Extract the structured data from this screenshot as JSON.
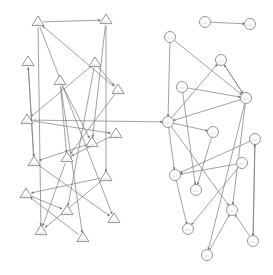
{
  "diagram": {
    "type": "directed-graph",
    "width": 273,
    "height": 275,
    "colors": {
      "stroke": "#7a7a7a",
      "node_fill": "#ffffff",
      "background": "#ffffff"
    },
    "groups": [
      {
        "name": "triangle-cluster",
        "shape": "triangle"
      },
      {
        "name": "circle-cluster",
        "shape": "circle"
      }
    ],
    "nodes": [
      {
        "id": "T1",
        "shape": "triangle",
        "x": 38,
        "y": 22
      },
      {
        "id": "T2",
        "shape": "triangle",
        "x": 106,
        "y": 20
      },
      {
        "id": "T3",
        "shape": "triangle",
        "x": 28,
        "y": 62
      },
      {
        "id": "T4",
        "shape": "triangle",
        "x": 95,
        "y": 63
      },
      {
        "id": "T5",
        "shape": "triangle",
        "x": 60,
        "y": 81
      },
      {
        "id": "T6",
        "shape": "triangle",
        "x": 118,
        "y": 90
      },
      {
        "id": "T7",
        "shape": "triangle",
        "x": 27,
        "y": 120
      },
      {
        "id": "T8",
        "shape": "triangle",
        "x": 116,
        "y": 134
      },
      {
        "id": "T9",
        "shape": "triangle",
        "x": 92,
        "y": 143
      },
      {
        "id": "T10",
        "shape": "triangle",
        "x": 34,
        "y": 162
      },
      {
        "id": "T11",
        "shape": "triangle",
        "x": 67,
        "y": 158
      },
      {
        "id": "T12",
        "shape": "triangle",
        "x": 106,
        "y": 177
      },
      {
        "id": "T13",
        "shape": "triangle",
        "x": 26,
        "y": 194
      },
      {
        "id": "T14",
        "shape": "triangle",
        "x": 67,
        "y": 211
      },
      {
        "id": "T15",
        "shape": "triangle",
        "x": 114,
        "y": 219
      },
      {
        "id": "T16",
        "shape": "triangle",
        "x": 41,
        "y": 231
      },
      {
        "id": "T17",
        "shape": "triangle",
        "x": 83,
        "y": 238
      },
      {
        "id": "C1",
        "shape": "circle",
        "x": 205,
        "y": 22
      },
      {
        "id": "C2",
        "shape": "circle",
        "x": 250,
        "y": 24
      },
      {
        "id": "C3",
        "shape": "circle",
        "x": 170,
        "y": 37
      },
      {
        "id": "C4",
        "shape": "circle",
        "x": 221,
        "y": 60
      },
      {
        "id": "C5",
        "shape": "circle",
        "x": 182,
        "y": 87
      },
      {
        "id": "C6",
        "shape": "circle",
        "x": 246,
        "y": 98
      },
      {
        "id": "C7",
        "shape": "circle",
        "x": 168,
        "y": 122
      },
      {
        "id": "C8",
        "shape": "circle",
        "x": 213,
        "y": 132
      },
      {
        "id": "C9",
        "shape": "circle",
        "x": 255,
        "y": 139
      },
      {
        "id": "C10",
        "shape": "circle",
        "x": 175,
        "y": 175
      },
      {
        "id": "C11",
        "shape": "circle",
        "x": 242,
        "y": 163
      },
      {
        "id": "C12",
        "shape": "circle",
        "x": 196,
        "y": 190
      },
      {
        "id": "C13",
        "shape": "circle",
        "x": 232,
        "y": 210
      },
      {
        "id": "C14",
        "shape": "circle",
        "x": 188,
        "y": 229
      },
      {
        "id": "C15",
        "shape": "circle",
        "x": 253,
        "y": 241
      },
      {
        "id": "C16",
        "shape": "circle",
        "x": 207,
        "y": 255
      }
    ],
    "edges": [
      [
        "T1",
        "T2"
      ],
      [
        "T2",
        "T12"
      ],
      [
        "T6",
        "T1"
      ],
      [
        "T1",
        "T16"
      ],
      [
        "T1",
        "T15"
      ],
      [
        "T3",
        "T10"
      ],
      [
        "T10",
        "T3"
      ],
      [
        "T4",
        "T6"
      ],
      [
        "T4",
        "T7"
      ],
      [
        "T4",
        "T14"
      ],
      [
        "T5",
        "T9"
      ],
      [
        "T5",
        "T17"
      ],
      [
        "T5",
        "T11"
      ],
      [
        "T7",
        "T8"
      ],
      [
        "T7",
        "C7"
      ],
      [
        "T6",
        "T11"
      ],
      [
        "T8",
        "T11"
      ],
      [
        "T9",
        "T10"
      ],
      [
        "T10",
        "T15"
      ],
      [
        "T11",
        "T16"
      ],
      [
        "T12",
        "T13"
      ],
      [
        "T13",
        "T14"
      ],
      [
        "T12",
        "T16"
      ],
      [
        "T17",
        "T13"
      ],
      [
        "T2",
        "T9"
      ],
      [
        "C1",
        "C2"
      ],
      [
        "C3",
        "C7"
      ],
      [
        "C3",
        "C6"
      ],
      [
        "C4",
        "C6"
      ],
      [
        "C6",
        "C4"
      ],
      [
        "C7",
        "C4"
      ],
      [
        "C5",
        "C6"
      ],
      [
        "C5",
        "C12"
      ],
      [
        "C6",
        "C7"
      ],
      [
        "C6",
        "C13"
      ],
      [
        "C6",
        "C16"
      ],
      [
        "C7",
        "C8"
      ],
      [
        "C7",
        "C10"
      ],
      [
        "C7",
        "C13"
      ],
      [
        "C9",
        "C10"
      ],
      [
        "C11",
        "C10"
      ],
      [
        "C11",
        "C14"
      ],
      [
        "C10",
        "C14"
      ],
      [
        "C15",
        "C13"
      ],
      [
        "C16",
        "C13"
      ],
      [
        "C15",
        "C9"
      ],
      [
        "C9",
        "C15"
      ],
      [
        "C8",
        "C12"
      ]
    ]
  }
}
